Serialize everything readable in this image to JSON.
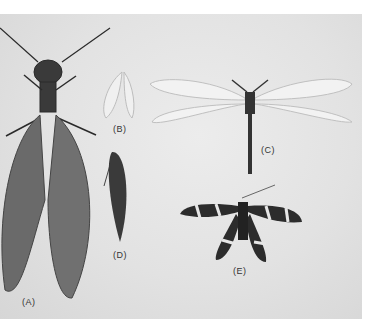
{
  "figure": {
    "specimens": [
      {
        "id": "A",
        "label": "(A)",
        "description": "large dobsonfly-like specimen with long antennae and mottled veined wings, partially cropped at left"
      },
      {
        "id": "B",
        "label": "(B)",
        "description": "small pale lacewing with wings folded"
      },
      {
        "id": "C",
        "label": "(C)",
        "description": "antlion with clubbed antennae, long transparent outspread wings and slender abdomen"
      },
      {
        "id": "D",
        "label": "(D)",
        "description": "small dark specimen with wings folded, elongated"
      },
      {
        "id": "E",
        "label": "(E)",
        "description": "owlfly/ascalaphid with black-and-white banded wings outspread"
      }
    ],
    "colors": {
      "background": "#e3e3e3",
      "page": "#ffffff",
      "specimen_dark": "#2a2a2a"
    }
  }
}
